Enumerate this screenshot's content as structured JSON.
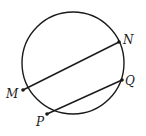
{
  "diagram": {
    "type": "circle-with-chords",
    "circle": {
      "cx": 73,
      "cy": 63,
      "r": 51
    },
    "points": [
      {
        "id": "N",
        "label": "N",
        "x": 119,
        "y": 42,
        "lx": 123,
        "ly": 43
      },
      {
        "id": "Q",
        "label": "Q",
        "x": 122,
        "y": 80,
        "lx": 125,
        "ly": 85
      },
      {
        "id": "M",
        "label": "M",
        "x": 23,
        "y": 90,
        "lx": 6,
        "ly": 98
      },
      {
        "id": "P",
        "label": "P",
        "x": 47,
        "y": 114,
        "lx": 36,
        "ly": 126
      }
    ],
    "segments": [
      {
        "from": "M",
        "to": "N"
      },
      {
        "from": "P",
        "to": "Q"
      }
    ],
    "colors": {
      "stroke": "#1a1a1a",
      "background": "#ffffff"
    }
  }
}
